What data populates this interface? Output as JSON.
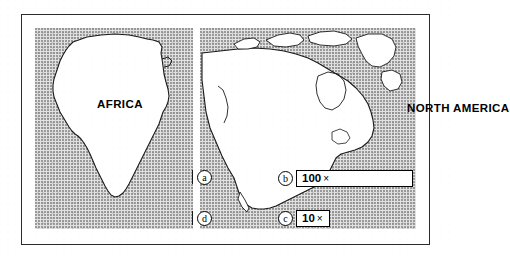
{
  "figure": {
    "type": "scanned-textbook-figure",
    "background_color": "#ffffff",
    "frame_border_color": "#2b2b2b",
    "panel_fill_color": "#e2e2e2",
    "outline_color": "#000000"
  },
  "panels": [
    {
      "id": "africa",
      "title": "AFRICA",
      "continent": "Africa",
      "markers": [
        "a",
        "d"
      ]
    },
    {
      "id": "north-america",
      "title": "NORTH AMERICA",
      "continent": "North America",
      "markers": [
        "b",
        "c"
      ]
    }
  ],
  "markers": {
    "a": {
      "label": "a",
      "has_tick": true
    },
    "d": {
      "label": "d",
      "has_tick": true
    },
    "b": {
      "label": "b",
      "has_tick": false
    },
    "c": {
      "label": "c",
      "has_tick": false
    }
  },
  "scale_boxes": [
    {
      "marker": "b",
      "number": "100",
      "symbol": "×",
      "full_text": "100×",
      "width_px": 117
    },
    {
      "marker": "c",
      "number": "10",
      "symbol": "×",
      "full_text": "10×",
      "width_px": 34
    }
  ]
}
